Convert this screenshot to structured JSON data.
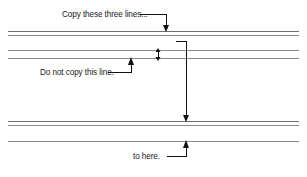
{
  "figure": {
    "background_color": "#ffffff",
    "rule_color": "#8a8a8a",
    "leader_color": "#111111",
    "text_color": "#1a1a1a",
    "width": 307,
    "height": 177
  },
  "annotations": [
    {
      "id": "copy-three-lines",
      "label": "Copy these three lines...",
      "text_x": 62,
      "text_y": 17,
      "leader": "M 140 14 L 166 14 L 166 26",
      "arrow_x": 166,
      "arrow_y": 31,
      "arrow_dir": "down"
    },
    {
      "id": "do-not-copy",
      "label": "Do not copy this line.",
      "text_x": 40,
      "text_y": 75,
      "leader": "M 108 72 L 131 72 L 131 64",
      "arrow_x": 131,
      "arrow_y": 58,
      "arrow_dir": "up"
    },
    {
      "id": "to-here",
      "label": "to here.",
      "text_x": 133,
      "text_y": 159,
      "leader": "M 167 156 L 186 156 L 186 147",
      "arrow_x": 186,
      "arrow_y": 141,
      "arrow_dir": "up"
    }
  ],
  "span_marker": {
    "id": "copy-span",
    "top_stub": "M 176 41 L 186 41 L 186 116",
    "arrow_x": 186,
    "arrow_y": 122,
    "arrow_dir": "down"
  },
  "gap_marker": {
    "id": "line-gap-double-arrow",
    "x": 158,
    "top_y": 50,
    "bottom_y": 58
  },
  "rules": [
    {
      "id": "rule-1",
      "y": 31,
      "x1": 8,
      "x2": 299,
      "weight": "dark"
    },
    {
      "id": "rule-2",
      "y": 35,
      "x1": 8,
      "x2": 299,
      "weight": "light"
    },
    {
      "id": "rule-3",
      "y": 50,
      "x1": 8,
      "x2": 299,
      "weight": "light"
    },
    {
      "id": "rule-4",
      "y": 58,
      "x1": 8,
      "x2": 299,
      "weight": "light"
    },
    {
      "id": "rule-5",
      "y": 121,
      "x1": 8,
      "x2": 299,
      "weight": "dark"
    },
    {
      "id": "rule-6",
      "y": 125,
      "x1": 8,
      "x2": 299,
      "weight": "light"
    },
    {
      "id": "rule-7",
      "y": 141,
      "x1": 8,
      "x2": 299,
      "weight": "light"
    }
  ]
}
